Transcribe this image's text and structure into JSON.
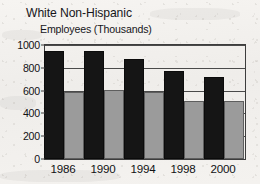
{
  "chart_data": {
    "type": "bar",
    "title": "White Non-Hispanic",
    "subtitle": "Employees (Thousands)",
    "xlabel": "",
    "ylabel": "Employees (Thousands)",
    "categories": [
      "1986",
      "1990",
      "1994",
      "1998",
      "2000"
    ],
    "series": [
      {
        "name": "series-1",
        "color": "#151515",
        "values": [
          945,
          948,
          875,
          770,
          720
        ]
      },
      {
        "name": "series-2",
        "color": "#9b9b9b",
        "values": [
          585,
          603,
          585,
          505,
          510
        ]
      }
    ],
    "ylim": [
      0,
      1000
    ],
    "yticks": [
      0,
      200,
      400,
      600,
      800,
      1000
    ],
    "ytick_labels": [
      "0",
      "200",
      "400",
      "600",
      "800",
      "1000"
    ],
    "grid": true,
    "legend": "none",
    "legend_position": "none",
    "annotations": []
  },
  "colors": {
    "series_1": "#151515",
    "series_2": "#9b9b9b",
    "axis": "#3d3d3d",
    "text": "#16161a",
    "background": "#f3f1ee"
  }
}
